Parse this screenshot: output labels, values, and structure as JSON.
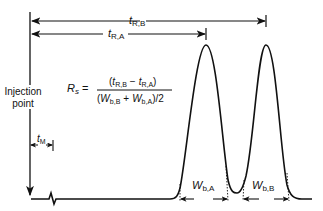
{
  "diagram": {
    "labels": {
      "t_RB_main": "t",
      "t_RB_sub": "R,B",
      "t_RA_main": "t",
      "t_RA_sub": "R,A",
      "t_M_main": "t",
      "t_M_sub": "M",
      "injection_line1": "Injection",
      "injection_line2": "point",
      "W_bA_main": "W",
      "W_bA_sub": "b,A",
      "W_bB_main": "W",
      "W_bB_sub": "b,B"
    },
    "equation": {
      "lhs_main": "R",
      "lhs_sub": "s",
      "equals": "=",
      "num_open": "(",
      "num_t1": "t",
      "num_t1_sub": "R,B",
      "num_minus": "−",
      "num_t2": "t",
      "num_t2_sub": "R,A",
      "num_close": ")",
      "den_open": "(",
      "den_w1": "W",
      "den_w1_sub": "b,B",
      "den_plus": "+",
      "den_w2": "W",
      "den_w2_sub": "b,A",
      "den_close": ")/2"
    },
    "colors": {
      "line": "#111111",
      "background": "#ffffff"
    }
  }
}
